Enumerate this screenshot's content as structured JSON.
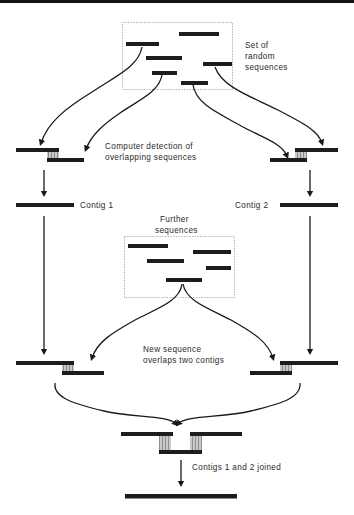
{
  "figure": {
    "type": "diagram",
    "background": "#ffffff",
    "ink_color": "#1a1a1a",
    "overlap_fill": "#b0b0b0"
  },
  "labels": {
    "set_of_random_sequences": [
      "Set  of",
      "random",
      "sequences"
    ],
    "computer_detection": [
      "Computer  detection  of",
      "overlapping  sequences"
    ],
    "contig_1": "Contig  1",
    "contig_2": "Contig  2",
    "further_sequences": [
      "Further",
      "sequences"
    ],
    "new_sequence_overlaps": [
      "New  sequence",
      "overlaps  two  contigs"
    ],
    "contigs_joined": "Contigs  1  and  2  joined"
  },
  "boxes": {
    "random_sequences_box": {
      "x": 122,
      "y": 22,
      "w": 110,
      "h": 67
    },
    "further_sequences_box": {
      "x": 124,
      "y": 236,
      "w": 110,
      "h": 61
    }
  },
  "random_sequences": [
    {
      "x": 179,
      "y": 32,
      "w": 40
    },
    {
      "x": 126,
      "y": 42,
      "w": 33
    },
    {
      "x": 146,
      "y": 56,
      "w": 36
    },
    {
      "x": 203,
      "y": 62,
      "w": 29
    },
    {
      "x": 152,
      "y": 71,
      "w": 25
    },
    {
      "x": 181,
      "y": 81,
      "w": 27
    }
  ],
  "further_sequences": [
    {
      "x": 128,
      "y": 244,
      "w": 40
    },
    {
      "x": 193,
      "y": 250,
      "w": 38
    },
    {
      "x": 147,
      "y": 259,
      "w": 37
    },
    {
      "x": 206,
      "y": 266,
      "w": 25
    },
    {
      "x": 166,
      "y": 278,
      "w": 36
    }
  ],
  "contig_bars": {
    "left_top": {
      "x": 16,
      "y": 148,
      "w": 43
    },
    "left_bottom": {
      "x": 47,
      "y": 158,
      "w": 37
    },
    "right_top": {
      "x": 295,
      "y": 148,
      "w": 43
    },
    "right_bottom": {
      "x": 270,
      "y": 158,
      "w": 37
    },
    "contig1_bar": {
      "x": 16,
      "y": 203,
      "w": 58
    },
    "contig2_bar": {
      "x": 280,
      "y": 203,
      "w": 58
    },
    "lower_left_top": {
      "x": 16,
      "y": 361,
      "w": 58
    },
    "lower_left_bottom": {
      "x": 62,
      "y": 371,
      "w": 42
    },
    "lower_right_top": {
      "x": 280,
      "y": 361,
      "w": 58
    },
    "lower_right_bottom": {
      "x": 250,
      "y": 371,
      "w": 42
    },
    "joined_left": {
      "x": 121,
      "y": 432,
      "w": 52
    },
    "joined_right": {
      "x": 190,
      "y": 432,
      "w": 52
    },
    "joined_mid": {
      "x": 159,
      "y": 450,
      "w": 42
    },
    "final_bar": {
      "x": 125,
      "y": 494,
      "w": 112
    }
  },
  "overlap_bands": [
    {
      "x": 47,
      "y": 150,
      "w": 12,
      "h": 10
    },
    {
      "x": 295,
      "y": 150,
      "w": 12,
      "h": 10
    },
    {
      "x": 62,
      "y": 363,
      "w": 12,
      "h": 10
    },
    {
      "x": 280,
      "y": 363,
      "w": 12,
      "h": 10
    },
    {
      "x": 159,
      "y": 434,
      "w": 12,
      "h": 18
    },
    {
      "x": 190,
      "y": 434,
      "w": 12,
      "h": 18
    }
  ],
  "bar_height": 4
}
